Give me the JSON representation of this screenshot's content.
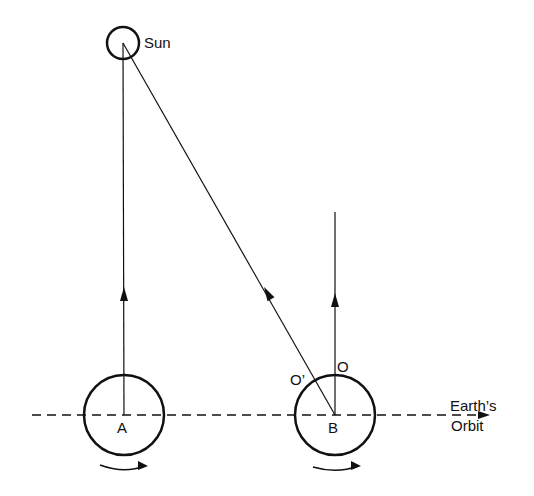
{
  "diagram": {
    "labels": {
      "sun": "Sun",
      "point_a": "A",
      "point_b": "B",
      "point_o": "O",
      "point_o_prime": "O’",
      "orbit_line1": "Earth’s",
      "orbit_line2": "Orbit"
    },
    "colors": {
      "stroke": "#111111",
      "background": "#ffffff"
    },
    "elements": {
      "sun": {
        "cx": 123,
        "cy": 43,
        "r": 16
      },
      "earth_a": {
        "cx": 124,
        "cy": 415,
        "r": 40
      },
      "earth_b": {
        "cx": 335,
        "cy": 415,
        "r": 40
      },
      "orbit_line": {
        "y": 415,
        "x1": 32,
        "x2": 490
      }
    }
  }
}
